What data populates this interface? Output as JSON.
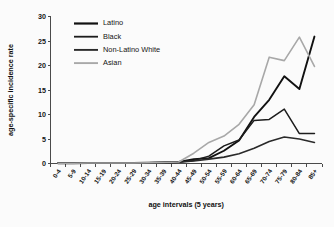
{
  "chart_data": {
    "type": "line",
    "title": "",
    "xlabel": "age intervals (5 years)",
    "ylabel": "age-specific incidence rate",
    "ylim": [
      0,
      30
    ],
    "yticks": [
      0,
      5,
      10,
      15,
      20,
      25,
      30
    ],
    "grid": false,
    "legend_position": "top-left",
    "categories": [
      "0-4",
      "5-9",
      "10-14",
      "15-19",
      "20-24",
      "25-29",
      "30-34",
      "35-39",
      "40-44",
      "45-49",
      "50-54",
      "55-59",
      "60-64",
      "65-69",
      "70-74",
      "75-79",
      "80-84",
      "85+"
    ],
    "series": [
      {
        "name": "Latino",
        "color": "#111111",
        "width": 1.9,
        "values": [
          0.05,
          0.05,
          0.1,
          0.1,
          0.1,
          0.1,
          0.15,
          0.2,
          0.3,
          0.9,
          1.1,
          2.6,
          4.7,
          9.5,
          13.0,
          17.8,
          15.2,
          25.9
        ]
      },
      {
        "name": "Black",
        "color": "#1c1c1c",
        "width": 1.5,
        "values": [
          0.05,
          0.05,
          0.1,
          0.1,
          0.1,
          0.1,
          0.15,
          0.2,
          0.3,
          0.6,
          1.5,
          3.6,
          4.8,
          8.8,
          9.0,
          11.1,
          6.1,
          6.1
        ]
      },
      {
        "name": "Non-Latino White",
        "color": "#2a2a2a",
        "width": 1.6,
        "values": [
          0.05,
          0.05,
          0.1,
          0.1,
          0.1,
          0.1,
          0.15,
          0.2,
          0.25,
          0.5,
          0.9,
          1.3,
          2.0,
          3.1,
          4.5,
          5.4,
          5.0,
          4.3
        ]
      },
      {
        "name": "Asian",
        "color": "#a8a8a8",
        "width": 1.6,
        "values": [
          0.05,
          0.05,
          0.1,
          0.1,
          0.1,
          0.1,
          0.15,
          0.2,
          0.3,
          2.1,
          4.3,
          5.6,
          8.0,
          12.0,
          21.7,
          21.0,
          25.8,
          19.8
        ]
      }
    ]
  }
}
